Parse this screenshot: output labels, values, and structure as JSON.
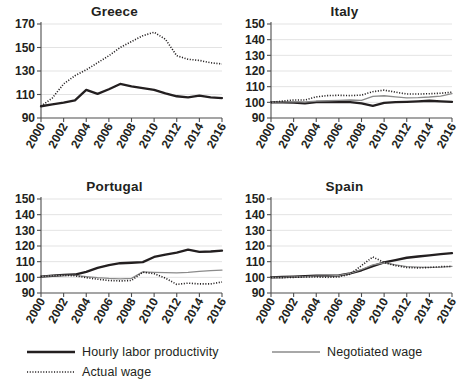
{
  "chart_data": [
    {
      "type": "line",
      "title": "Greece",
      "xlabel": "",
      "ylabel": "",
      "x": [
        2000,
        2001,
        2002,
        2003,
        2004,
        2005,
        2006,
        2007,
        2008,
        2009,
        2010,
        2011,
        2012,
        2013,
        2014,
        2015,
        2016
      ],
      "tick_x": [
        2000,
        2002,
        2004,
        2006,
        2008,
        2010,
        2012,
        2014,
        2016
      ],
      "xlim": [
        2000,
        2016
      ],
      "ylim": [
        90,
        170
      ],
      "yticks": [
        90,
        110,
        130,
        150,
        170
      ],
      "grid": "horizontal",
      "legend_position": "bottom",
      "series": [
        {
          "name": "Hourly labor productivity",
          "style": "solid-thick-black",
          "color": "#231f20",
          "values": [
            100,
            101.5,
            103,
            105,
            114,
            110.5,
            114.5,
            119,
            117,
            115.5,
            114,
            111,
            108.5,
            107.5,
            109,
            107.5,
            107
          ]
        },
        {
          "name": "Actual wage",
          "style": "dotted-black",
          "color": "#231f20",
          "values": [
            100,
            107,
            119,
            126,
            131,
            137,
            143,
            150,
            155,
            160,
            163,
            157,
            143,
            140,
            139,
            137,
            136
          ]
        }
      ]
    },
    {
      "type": "line",
      "title": "Italy",
      "xlabel": "",
      "ylabel": "",
      "x": [
        2000,
        2001,
        2002,
        2003,
        2004,
        2005,
        2006,
        2007,
        2008,
        2009,
        2010,
        2011,
        2012,
        2013,
        2014,
        2015,
        2016
      ],
      "tick_x": [
        2000,
        2002,
        2004,
        2006,
        2008,
        2010,
        2012,
        2014,
        2016
      ],
      "xlim": [
        2000,
        2016
      ],
      "ylim": [
        90,
        150
      ],
      "yticks": [
        90,
        100,
        110,
        120,
        130,
        140,
        150
      ],
      "grid": "horizontal",
      "legend_position": "bottom",
      "series": [
        {
          "name": "Hourly labor productivity",
          "style": "solid-thick-black",
          "color": "#231f20",
          "values": [
            100,
            100,
            99.8,
            99.3,
            100.2,
            100.2,
            100.3,
            100.2,
            99.3,
            97.7,
            99.6,
            100.1,
            100.3,
            100.6,
            101,
            100.6,
            100.3
          ]
        },
        {
          "name": "Negotiated wage",
          "style": "solid-thin-gray",
          "color": "#8b8b8b",
          "values": [
            100,
            100.3,
            100.5,
            100.2,
            100.8,
            101,
            101.3,
            101.5,
            101.3,
            103.8,
            104.2,
            103.5,
            102.8,
            103,
            103.4,
            104,
            105.5
          ]
        },
        {
          "name": "Actual wage",
          "style": "dotted-black",
          "color": "#231f20",
          "values": [
            100,
            100.8,
            101.5,
            101.5,
            103.5,
            104.3,
            104.5,
            104.3,
            104.6,
            106.8,
            107.8,
            106.5,
            105.3,
            105.3,
            105.5,
            105.8,
            106.5
          ]
        }
      ]
    },
    {
      "type": "line",
      "title": "Portugal",
      "xlabel": "",
      "ylabel": "",
      "x": [
        2000,
        2001,
        2002,
        2003,
        2004,
        2005,
        2006,
        2007,
        2008,
        2009,
        2010,
        2011,
        2012,
        2013,
        2014,
        2015,
        2016
      ],
      "tick_x": [
        2000,
        2002,
        2004,
        2006,
        2008,
        2010,
        2012,
        2014,
        2016
      ],
      "xlim": [
        2000,
        2016
      ],
      "ylim": [
        90,
        150
      ],
      "yticks": [
        90,
        100,
        110,
        120,
        130,
        140,
        150
      ],
      "grid": "horizontal",
      "legend_position": "bottom",
      "series": [
        {
          "name": "Hourly labor productivity",
          "style": "solid-thick-black",
          "color": "#231f20",
          "values": [
            100.5,
            101,
            101.5,
            101.8,
            103.5,
            106,
            107.8,
            109,
            109.3,
            109.7,
            113,
            114.5,
            115.8,
            117.7,
            116.3,
            116.5,
            117
          ]
        },
        {
          "name": "Negotiated wage",
          "style": "solid-thin-gray",
          "color": "#8b8b8b",
          "values": [
            100.5,
            101,
            101.3,
            101.2,
            100.5,
            99.8,
            99.3,
            99,
            99.3,
            103.5,
            103.2,
            103,
            102.8,
            103.2,
            103.8,
            104.3,
            104.6
          ]
        },
        {
          "name": "Actual wage",
          "style": "dotted-black",
          "color": "#231f20",
          "values": [
            100.5,
            101,
            101.3,
            101,
            99.8,
            98.8,
            98,
            97.7,
            98,
            103.3,
            102.3,
            99.5,
            95.5,
            96.3,
            95.8,
            95.8,
            97
          ]
        }
      ]
    },
    {
      "type": "line",
      "title": "Spain",
      "xlabel": "",
      "ylabel": "",
      "x": [
        2000,
        2001,
        2002,
        2003,
        2004,
        2005,
        2006,
        2007,
        2008,
        2009,
        2010,
        2011,
        2012,
        2013,
        2014,
        2015,
        2016
      ],
      "tick_x": [
        2000,
        2002,
        2004,
        2006,
        2008,
        2010,
        2012,
        2014,
        2016
      ],
      "xlim": [
        2000,
        2016
      ],
      "ylim": [
        90,
        150
      ],
      "yticks": [
        90,
        100,
        110,
        120,
        130,
        140,
        150
      ],
      "grid": "horizontal",
      "legend_position": "bottom",
      "series": [
        {
          "name": "Hourly labor productivity",
          "style": "solid-thick-black",
          "color": "#231f20",
          "values": [
            100,
            100.2,
            100.5,
            100.8,
            101,
            101,
            101.3,
            102.5,
            104.5,
            107.2,
            109.5,
            111,
            112.5,
            113.3,
            114,
            114.8,
            115.5
          ]
        },
        {
          "name": "Negotiated wage",
          "style": "solid-thin-gray",
          "color": "#8b8b8b",
          "values": [
            100,
            100,
            100.3,
            100.5,
            100.8,
            100.8,
            101.2,
            102.5,
            105,
            108,
            109.3,
            108,
            106.8,
            106.5,
            106.3,
            106.5,
            107
          ]
        },
        {
          "name": "Actual wage",
          "style": "dotted-black",
          "color": "#231f20",
          "values": [
            100,
            99.8,
            100,
            100.2,
            100.2,
            100,
            100.3,
            102,
            107.5,
            113,
            109.5,
            107.5,
            106.3,
            106,
            106.3,
            106.8,
            107
          ]
        }
      ]
    }
  ],
  "legend": {
    "items": [
      {
        "label": "Hourly labor productivity",
        "style": "solid-thick-black",
        "color": "#231f20"
      },
      {
        "label": "Negotiated wage",
        "style": "solid-thin-gray",
        "color": "#8b8b8b"
      },
      {
        "label": "Actual wage",
        "style": "dotted-black",
        "color": "#231f20"
      }
    ]
  }
}
